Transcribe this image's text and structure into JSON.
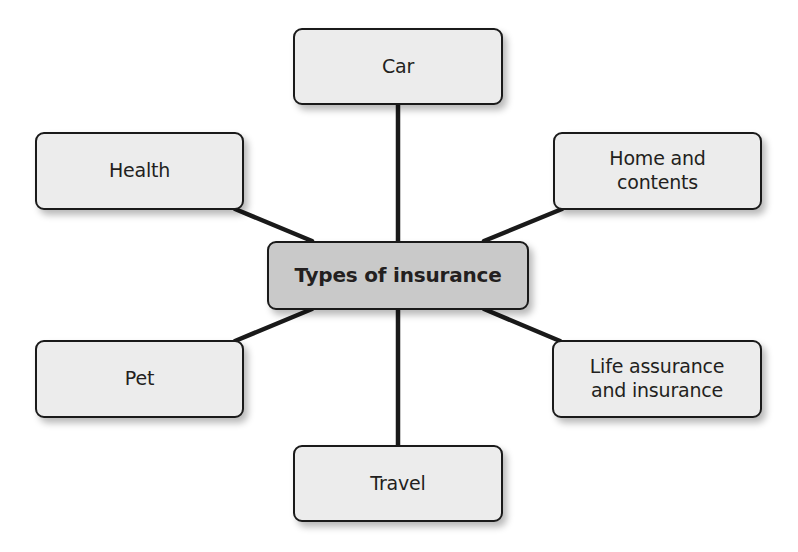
{
  "diagram": {
    "type": "mind-map",
    "central_node": {
      "label": "Types of insurance",
      "fill": "#c9c9c9"
    },
    "branch_fill": "#ececec",
    "line_color": "#1a1a1a",
    "branches": [
      {
        "id": "car",
        "label": "Car"
      },
      {
        "id": "health",
        "label": "Health"
      },
      {
        "id": "home",
        "label": "Home and\ncontents"
      },
      {
        "id": "pet",
        "label": "Pet"
      },
      {
        "id": "life",
        "label": "Life assurance\nand insurance"
      },
      {
        "id": "travel",
        "label": "Travel"
      }
    ]
  }
}
